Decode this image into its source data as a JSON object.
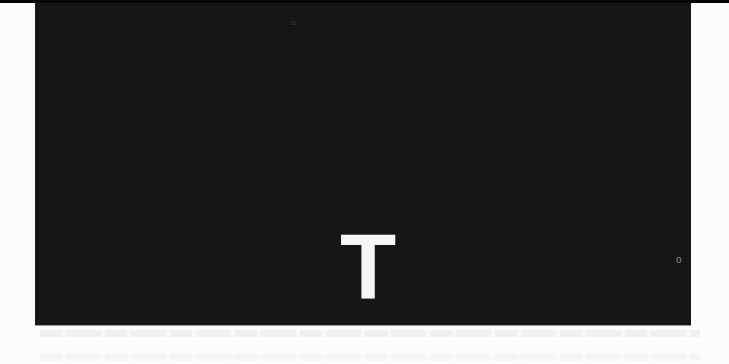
{
  "page": {
    "background_color": "#fcfcfc"
  },
  "image_panel": {
    "background_color": "#141414",
    "letter": "T",
    "letter_color": "#f6f6f6",
    "specks": [
      "o",
      "o"
    ]
  },
  "ghost_text": {
    "legible": false
  }
}
